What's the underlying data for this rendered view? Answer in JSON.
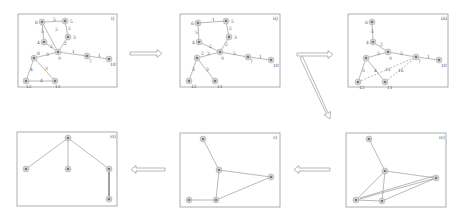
{
  "figure": {
    "panels": [
      {
        "id": "i",
        "label": "i)"
      },
      {
        "id": "ii",
        "label": "ii)"
      },
      {
        "id": "iii",
        "label": "iii)"
      },
      {
        "id": "iv",
        "label": "iv)"
      },
      {
        "id": "v",
        "label": "v)"
      },
      {
        "id": "vi",
        "label": "vi)"
      }
    ],
    "panel_i": {
      "node_labels": [
        "6",
        "5",
        "3",
        "4",
        "9",
        "7",
        "10",
        "8",
        "12",
        "11"
      ],
      "edge_weights": [
        "5",
        "5",
        "2",
        "2",
        "2",
        "2",
        "1",
        "3",
        "3",
        "1",
        "4",
        "3"
      ]
    },
    "panel_ii": {
      "node_labels": [
        "6",
        "5",
        "3",
        "4",
        "9",
        "7",
        "10",
        "8",
        "12",
        "11"
      ],
      "edge_weights": [
        "5",
        "5",
        "2",
        "2",
        "2",
        "1",
        "3",
        "3",
        "1",
        "4",
        "3"
      ]
    },
    "panel_iii": {
      "node_labels": [
        "6",
        "4",
        "9",
        "7",
        "10",
        "8",
        "12",
        "11"
      ],
      "edge_weights": [
        "5",
        "2",
        "2",
        "3",
        "5",
        "1",
        "11",
        "16",
        "3",
        "4"
      ]
    }
  }
}
